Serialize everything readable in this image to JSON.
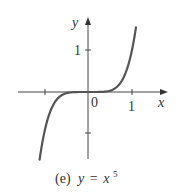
{
  "chart_data": {
    "type": "line",
    "title": "",
    "caption_prefix": "(e)",
    "caption_eq_y": "y",
    "caption_eq_sign": "=",
    "caption_eq_x": "x",
    "caption_eq_exp": "5",
    "function": "y = x^5",
    "xlabel": "x",
    "ylabel": "y",
    "x_ticks": [
      -1,
      0,
      1
    ],
    "x_tick_labels": {
      "origin": "0",
      "one": "1"
    },
    "y_ticks": [
      -1,
      1
    ],
    "y_tick_labels": {
      "one": "1"
    },
    "xlim": [
      -1.6,
      1.8
    ],
    "ylim": [
      -1.6,
      1.75
    ],
    "grid": false,
    "series": [
      {
        "name": "y = x^5",
        "x": [
          -1.1,
          -1.0,
          -0.9,
          -0.8,
          -0.6,
          -0.4,
          -0.2,
          0,
          0.2,
          0.4,
          0.6,
          0.8,
          0.9,
          1.0,
          1.09
        ],
        "values": [
          -1.61,
          -1.0,
          -0.59,
          -0.33,
          -0.08,
          -0.01,
          0.0,
          0,
          0.0,
          0.01,
          0.08,
          0.33,
          0.59,
          1.0,
          1.54
        ]
      }
    ],
    "colors": {
      "curve": "#555555",
      "axes": "#444444"
    }
  }
}
